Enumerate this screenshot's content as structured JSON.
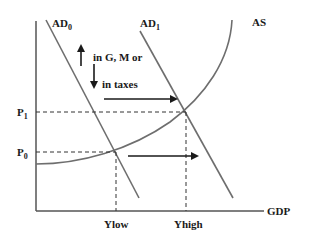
{
  "diagram": {
    "type": "economics-ad-as",
    "colors": {
      "background": "#ffffff",
      "axis": "#555555",
      "curve": "#6e6e6e",
      "arrow": "#1a1a1a",
      "text": "#1a1a1a",
      "dashed": "#333333"
    },
    "axes": {
      "x_label": "GDP",
      "y_label": ""
    },
    "curves": {
      "ad0": {
        "label": "AD",
        "sub": "0"
      },
      "ad1": {
        "label": "AD",
        "sub": "1"
      },
      "as": {
        "label": "AS"
      }
    },
    "price_levels": {
      "p1": {
        "label": "P",
        "sub": "1"
      },
      "p0": {
        "label": "P",
        "sub": "0"
      }
    },
    "output_levels": {
      "low": "Ylow",
      "high": "Yhigh"
    },
    "annotation": {
      "line1": "in G, M or",
      "line2": "in taxes",
      "up_arrow": "increase",
      "down_arrow": "decrease"
    }
  }
}
